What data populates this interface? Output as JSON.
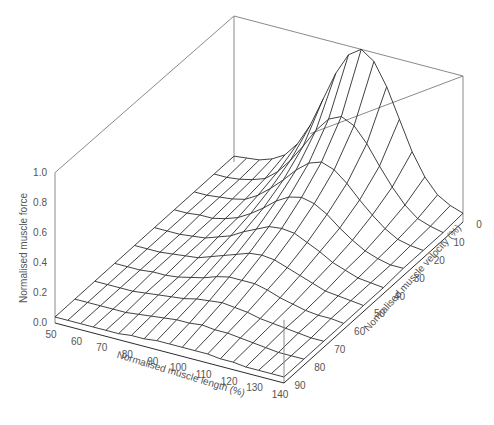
{
  "chart_data": {
    "type": "surface3d",
    "title": "",
    "xlabel": "Normalised muscle length (%)",
    "ylabel": "Normalised muscle velocity (%)",
    "zlabel": "Normalised muscle force",
    "x_ticks": [
      50,
      60,
      70,
      80,
      90,
      100,
      110,
      120,
      130,
      140
    ],
    "y_ticks": [
      0,
      10,
      20,
      30,
      40,
      50,
      60,
      70,
      80,
      90
    ],
    "z_ticks": [
      "0.0",
      "0.2",
      "0.4",
      "0.6",
      "0.8",
      "1.0"
    ],
    "xlim": [
      50,
      140
    ],
    "ylim": [
      0,
      90
    ],
    "zlim": [
      0,
      1.0
    ],
    "grid_x": [
      50,
      55,
      60,
      65,
      70,
      75,
      80,
      85,
      90,
      95,
      100,
      105,
      110,
      115,
      120,
      125,
      130,
      135,
      140
    ],
    "grid_y": [
      0,
      10,
      20,
      30,
      40,
      50,
      60,
      70,
      80,
      90
    ],
    "z": [
      [
        0.04,
        0.05,
        0.06,
        0.09,
        0.14,
        0.24,
        0.39,
        0.59,
        0.79,
        0.94,
        1.0,
        0.94,
        0.79,
        0.59,
        0.39,
        0.24,
        0.14,
        0.09,
        0.06
      ],
      [
        0.04,
        0.04,
        0.05,
        0.07,
        0.1,
        0.17,
        0.27,
        0.39,
        0.52,
        0.62,
        0.66,
        0.62,
        0.52,
        0.39,
        0.27,
        0.17,
        0.1,
        0.07,
        0.05
      ],
      [
        0.04,
        0.04,
        0.05,
        0.06,
        0.08,
        0.13,
        0.2,
        0.28,
        0.37,
        0.44,
        0.47,
        0.44,
        0.37,
        0.28,
        0.2,
        0.13,
        0.08,
        0.06,
        0.05
      ],
      [
        0.04,
        0.04,
        0.05,
        0.05,
        0.07,
        0.1,
        0.15,
        0.21,
        0.28,
        0.33,
        0.35,
        0.33,
        0.28,
        0.21,
        0.15,
        0.1,
        0.07,
        0.05,
        0.05
      ],
      [
        0.04,
        0.04,
        0.04,
        0.05,
        0.06,
        0.09,
        0.12,
        0.17,
        0.21,
        0.25,
        0.26,
        0.25,
        0.21,
        0.17,
        0.12,
        0.09,
        0.06,
        0.05,
        0.04
      ],
      [
        0.04,
        0.04,
        0.04,
        0.05,
        0.06,
        0.07,
        0.1,
        0.13,
        0.16,
        0.19,
        0.2,
        0.19,
        0.16,
        0.13,
        0.1,
        0.07,
        0.06,
        0.05,
        0.04
      ],
      [
        0.04,
        0.04,
        0.04,
        0.05,
        0.05,
        0.06,
        0.08,
        0.1,
        0.13,
        0.15,
        0.15,
        0.15,
        0.13,
        0.1,
        0.08,
        0.06,
        0.05,
        0.05,
        0.04
      ],
      [
        0.04,
        0.04,
        0.04,
        0.04,
        0.05,
        0.06,
        0.07,
        0.08,
        0.1,
        0.11,
        0.12,
        0.11,
        0.1,
        0.08,
        0.07,
        0.06,
        0.05,
        0.04,
        0.04
      ],
      [
        0.04,
        0.04,
        0.04,
        0.04,
        0.04,
        0.05,
        0.06,
        0.07,
        0.08,
        0.08,
        0.09,
        0.08,
        0.08,
        0.07,
        0.06,
        0.05,
        0.04,
        0.04,
        0.04
      ],
      [
        0.04,
        0.04,
        0.04,
        0.04,
        0.04,
        0.04,
        0.05,
        0.05,
        0.06,
        0.06,
        0.06,
        0.06,
        0.06,
        0.05,
        0.05,
        0.04,
        0.04,
        0.04,
        0.04
      ]
    ],
    "grid_on": false,
    "legend": null
  },
  "style": {
    "line_color": "#2b2b2b",
    "frame_color": "#8a8a8a",
    "text_color": "#555555",
    "background": "#ffffff"
  }
}
